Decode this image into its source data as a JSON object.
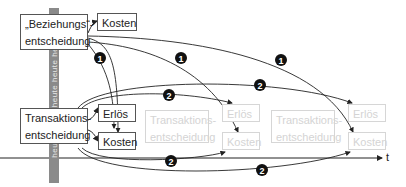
{
  "diagram": {
    "pole": {
      "label": "heute heute heute heute heute",
      "color": "#8a8a8a"
    },
    "boxes": {
      "beziehung": {
        "line1": "„Beziehungs“-",
        "line2": "entscheidung"
      },
      "beziehung_kosten": "Kosten",
      "transaktion": {
        "line1": "Transaktions-",
        "line2": "entscheidung"
      },
      "transaktion_erloes": "Erlös",
      "transaktion_kosten": "Kosten",
      "future1": {
        "line1": "Transaktions-",
        "line2": "entscheidung",
        "erloes": "Erlös",
        "kosten": "Kosten"
      },
      "future2": {
        "line1": "Transaktions-",
        "line2": "entscheidung",
        "erloes": "Erlös",
        "kosten": "Kosten"
      }
    },
    "badges": {
      "one": "1",
      "two": "2"
    },
    "axis": {
      "label": "t"
    }
  }
}
